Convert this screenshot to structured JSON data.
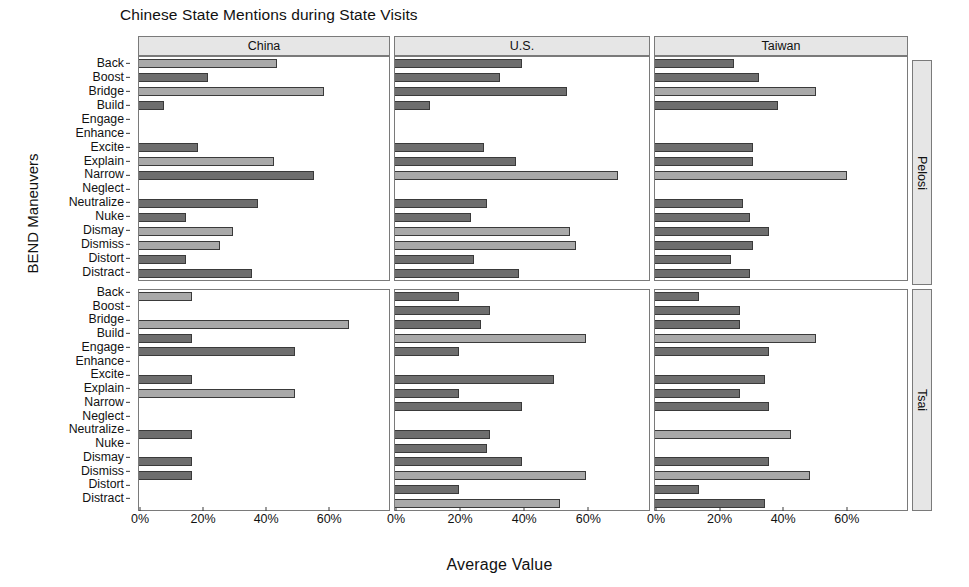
{
  "chart_data": {
    "type": "bar",
    "orientation": "horizontal",
    "title": "Chinese State Mentions during State Visits",
    "xlabel": "Average Value",
    "ylabel": "BEND Maneuvers",
    "xlim": [
      0,
      78
    ],
    "xticks": [
      0,
      20,
      40,
      60
    ],
    "xticklabels": [
      "0%",
      "20%",
      "40%",
      "60%"
    ],
    "grid": false,
    "legend": "none",
    "facet_columns": [
      "China",
      "U.S.",
      "Taiwan"
    ],
    "facet_rows": [
      "Pelosi",
      "Tsai"
    ],
    "categories": [
      "Back",
      "Boost",
      "Bridge",
      "Build",
      "Engage",
      "Enhance",
      "Excite",
      "Explain",
      "Narrow",
      "Neglect",
      "Neutralize",
      "Nuke",
      "Dismay",
      "Dismiss",
      "Distort",
      "Distract"
    ],
    "colors": {
      "bar_dark": "#6e6e6e",
      "bar_light": "#a9a9a9",
      "bar_outline": "#3a3a3a",
      "strip_background": "#e6e6e6",
      "panel_border": "#7a7a7a",
      "background": "#ffffff"
    },
    "panels": [
      {
        "row": "Pelosi",
        "column": "China",
        "values": [
          44,
          22,
          59,
          8,
          0,
          0,
          19,
          43,
          56,
          0,
          38,
          15,
          30,
          26,
          15,
          36
        ],
        "shades": [
          "light",
          "dark",
          "light",
          "dark",
          "dark",
          "dark",
          "dark",
          "light",
          "dark",
          "dark",
          "dark",
          "dark",
          "light",
          "light",
          "dark",
          "dark"
        ]
      },
      {
        "row": "Pelosi",
        "column": "U.S.",
        "values": [
          40,
          33,
          54,
          11,
          0,
          0,
          28,
          38,
          70,
          0,
          29,
          24,
          55,
          57,
          25,
          39
        ],
        "shades": [
          "dark",
          "dark",
          "dark",
          "dark",
          "dark",
          "dark",
          "dark",
          "dark",
          "light",
          "dark",
          "dark",
          "dark",
          "light",
          "light",
          "dark",
          "dark"
        ]
      },
      {
        "row": "Pelosi",
        "column": "Taiwan",
        "values": [
          25,
          33,
          51,
          39,
          0,
          0,
          31,
          31,
          61,
          0,
          28,
          30,
          36,
          31,
          24,
          30
        ],
        "shades": [
          "dark",
          "dark",
          "light",
          "dark",
          "dark",
          "dark",
          "dark",
          "dark",
          "light",
          "dark",
          "dark",
          "dark",
          "dark",
          "dark",
          "dark",
          "dark"
        ]
      },
      {
        "row": "Tsai",
        "column": "China",
        "values": [
          17,
          0,
          67,
          17,
          50,
          0,
          17,
          50,
          0,
          0,
          17,
          0,
          17,
          17,
          0,
          0
        ],
        "shades": [
          "light",
          "dark",
          "light",
          "dark",
          "dark",
          "dark",
          "dark",
          "light",
          "dark",
          "dark",
          "dark",
          "dark",
          "dark",
          "dark",
          "dark",
          "dark"
        ]
      },
      {
        "row": "Tsai",
        "column": "U.S.",
        "values": [
          20,
          30,
          27,
          60,
          20,
          0,
          50,
          20,
          40,
          0,
          30,
          29,
          40,
          60,
          20,
          52
        ],
        "shades": [
          "dark",
          "dark",
          "dark",
          "light",
          "dark",
          "dark",
          "dark",
          "dark",
          "dark",
          "dark",
          "dark",
          "dark",
          "dark",
          "light",
          "dark",
          "light"
        ]
      },
      {
        "row": "Tsai",
        "column": "Taiwan",
        "values": [
          14,
          27,
          27,
          51,
          36,
          0,
          35,
          27,
          36,
          0,
          43,
          0,
          36,
          49,
          14,
          35
        ],
        "shades": [
          "dark",
          "dark",
          "dark",
          "light",
          "dark",
          "dark",
          "dark",
          "dark",
          "dark",
          "dark",
          "light",
          "dark",
          "dark",
          "light",
          "dark",
          "dark"
        ]
      }
    ]
  }
}
